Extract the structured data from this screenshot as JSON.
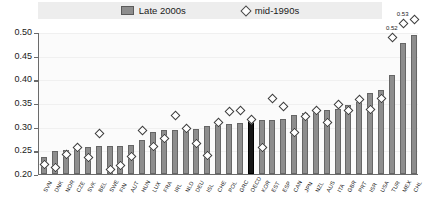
{
  "legend": {
    "series": [
      {
        "label": "Late 2000s",
        "marker": "bar-swatch",
        "color": "#8d8d8d"
      },
      {
        "label": "mid-1990s",
        "marker": "diamond-marker",
        "color": "#ffffff"
      }
    ]
  },
  "axis": {
    "y_ticks": [
      "0.20",
      "0.25",
      "0.30",
      "0.35",
      "0.40",
      "0.45",
      "0.50"
    ]
  },
  "annotations": [
    {
      "text": "0.52",
      "for": "TUR"
    },
    {
      "text": "0.53",
      "for": "MEX"
    }
  ],
  "chart_data": {
    "type": "bar",
    "title": "",
    "xlabel": "",
    "ylabel": "",
    "ylim": [
      0.2,
      0.5
    ],
    "grid": true,
    "legend_position": "top",
    "highlight_category": "OECD",
    "categories": [
      "SVN",
      "DNK",
      "NOR",
      "CZE",
      "SVK",
      "BEL",
      "SWE",
      "FIN",
      "AUT",
      "HUN",
      "LUX",
      "FRA",
      "IRL",
      "NLD",
      "DEU",
      "ISL",
      "CHE",
      "POL",
      "GRC",
      "OECD",
      "KOR",
      "EST",
      "ESP",
      "CAN",
      "JPN",
      "NZL",
      "AUS",
      "ITA",
      "GBR",
      "PRT",
      "ISR",
      "USA",
      "TUR",
      "MEX",
      "CHL"
    ],
    "series": [
      {
        "name": "Late 2000s",
        "type": "bar",
        "values": [
          0.236,
          0.248,
          0.25,
          0.256,
          0.257,
          0.259,
          0.259,
          0.259,
          0.261,
          0.272,
          0.288,
          0.293,
          0.293,
          0.294,
          0.295,
          0.301,
          0.303,
          0.305,
          0.307,
          0.314,
          0.315,
          0.315,
          0.317,
          0.324,
          0.329,
          0.33,
          0.336,
          0.337,
          0.345,
          0.353,
          0.371,
          0.378,
          0.409,
          0.476,
          0.494
        ]
      },
      {
        "name": "mid-1990s",
        "type": "scatter",
        "values": [
          0.222,
          0.215,
          0.243,
          0.257,
          0.235,
          0.287,
          0.211,
          0.218,
          0.238,
          0.294,
          0.259,
          0.277,
          0.324,
          0.297,
          0.266,
          0.24,
          0.309,
          0.333,
          0.336,
          0.316,
          0.257,
          0.361,
          0.343,
          0.289,
          0.323,
          0.335,
          0.309,
          0.348,
          0.336,
          0.359,
          0.338,
          0.361,
          0.49,
          0.519,
          0.527
        ]
      }
    ]
  }
}
